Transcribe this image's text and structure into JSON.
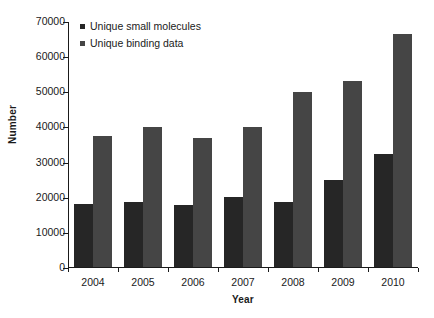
{
  "chart_data": {
    "type": "bar",
    "title": "",
    "xlabel": "Year",
    "ylabel": "Number",
    "categories": [
      "2004",
      "2005",
      "2006",
      "2007",
      "2008",
      "2009",
      "2010"
    ],
    "series": [
      {
        "name": "Unique small molecules",
        "color": "#262626",
        "values": [
          17800,
          18500,
          17700,
          19800,
          18500,
          24700,
          32200
        ]
      },
      {
        "name": "Unique binding data",
        "color": "#454545",
        "values": [
          37400,
          39800,
          36800,
          39900,
          49800,
          52800,
          66200
        ]
      }
    ],
    "ylim": [
      0,
      70000
    ],
    "ytick_step": 10000,
    "yticks": [
      0,
      10000,
      20000,
      30000,
      40000,
      50000,
      60000,
      70000
    ],
    "ytick_labels": [
      "0",
      "10000",
      "20000",
      "30000",
      "40000",
      "50000",
      "60000",
      "70000"
    ],
    "grid": false,
    "legend_position": "top-left",
    "background": "#ffffff",
    "axis_color": "#1a1a1a"
  },
  "legend": {
    "items": [
      {
        "label": "Unique small molecules",
        "marker": "square-marker"
      },
      {
        "label": "Unique binding data",
        "marker": "square-marker"
      }
    ]
  },
  "axes": {
    "y_title": "Number",
    "x_title": "Year"
  }
}
